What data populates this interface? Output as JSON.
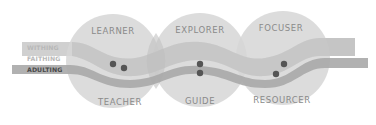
{
  "diagram": {
    "bands": [
      {
        "label": "WITHING",
        "color": "#bdbdbd"
      },
      {
        "label": "FAITHING",
        "color": "#bdbdbd"
      },
      {
        "label": "ADULTING",
        "color": "#555555"
      }
    ],
    "circles": [
      {
        "top_label": "LEARNER",
        "bottom_label": "TEACHER"
      },
      {
        "top_label": "EXPLORER",
        "bottom_label": "GUIDE"
      },
      {
        "top_label": "FOCUSER",
        "bottom_label": "RESOURCER"
      }
    ],
    "colors": {
      "circle_fill": "#d6d6d6",
      "wide_band": "#c4c4c4",
      "narrow_band": "#a6a6a6",
      "dot": "#555555",
      "label_text": "#8a8a8a"
    }
  }
}
